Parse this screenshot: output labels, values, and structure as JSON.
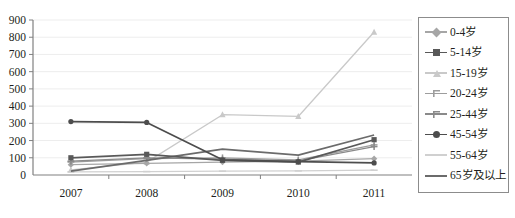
{
  "chart_data": {
    "type": "line",
    "title": "",
    "subtitle": "",
    "xlabel": "",
    "ylabel": "",
    "categories": [
      "2007",
      "2008",
      "2009",
      "2010",
      "2011"
    ],
    "x": [
      2007,
      2008,
      2009,
      2010,
      2011
    ],
    "ylim": [
      0,
      900
    ],
    "ytick_step": 100,
    "ytick_labels": [
      "900",
      "800",
      "700",
      "600",
      "500",
      "400",
      "300",
      "200",
      "100",
      "0"
    ],
    "xtick_labels": [
      "2007",
      "2008",
      "2009",
      "2010",
      "2011"
    ],
    "grid": true,
    "legend_position": "right",
    "series": [
      {
        "name": "0-4岁",
        "marker": "diamond",
        "color": "#a6a6a6",
        "values": [
          60,
          68,
          75,
          80,
          95
        ]
      },
      {
        "name": "5-14岁",
        "marker": "square",
        "color": "#595959",
        "values": [
          100,
          120,
          85,
          75,
          205
        ]
      },
      {
        "name": "15-19岁",
        "marker": "triangle",
        "color": "#c9c9c9",
        "values": [
          30,
          75,
          350,
          340,
          830
        ]
      },
      {
        "name": "20-24岁",
        "marker": "cross",
        "color": "#9d9d9d",
        "values": [
          75,
          95,
          100,
          88,
          175
        ]
      },
      {
        "name": "25-44岁",
        "marker": "asterisk",
        "color": "#8a8a8a",
        "values": [
          80,
          100,
          92,
          82,
          165
        ]
      },
      {
        "name": "45-54岁",
        "marker": "circle",
        "color": "#4d4d4d",
        "values": [
          310,
          305,
          88,
          78,
          70
        ]
      },
      {
        "name": "55-64岁",
        "marker": "dash",
        "color": "#d0d0d0",
        "values": [
          18,
          20,
          22,
          24,
          28
        ]
      },
      {
        "name": "65岁及以上",
        "marker": "none",
        "color": "#6b6b6b",
        "values": [
          22,
          85,
          150,
          115,
          232
        ]
      }
    ]
  },
  "legend": {
    "items": [
      {
        "label": "0-4岁",
        "marker": "diamond",
        "color": "#a6a6a6"
      },
      {
        "label": "5-14岁",
        "marker": "square",
        "color": "#595959"
      },
      {
        "label": "15-19岁",
        "marker": "triangle",
        "color": "#c9c9c9"
      },
      {
        "label": "20-24岁",
        "marker": "cross",
        "color": "#9d9d9d"
      },
      {
        "label": "25-44岁",
        "marker": "asterisk",
        "color": "#8a8a8a"
      },
      {
        "label": "45-54岁",
        "marker": "circle",
        "color": "#4d4d4d"
      },
      {
        "label": "55-64岁",
        "marker": "dash",
        "color": "#d0d0d0"
      },
      {
        "label": "65岁及以上",
        "marker": "none",
        "color": "#6b6b6b"
      }
    ]
  },
  "colors": {
    "axis": "#808080",
    "grid": "#ededed",
    "text": "#231f20",
    "legend_border": "#8c8c8c",
    "background": "#ffffff"
  }
}
